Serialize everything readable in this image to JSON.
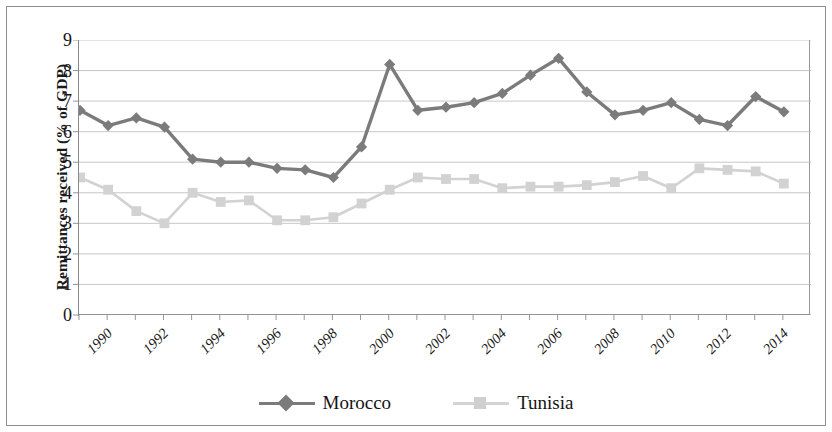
{
  "chart_data": {
    "type": "line",
    "title": "",
    "xlabel": "",
    "ylabel": "Remittances received (% of GDP)",
    "x": [
      1990,
      1991,
      1992,
      1993,
      1994,
      1995,
      1996,
      1997,
      1998,
      1999,
      2000,
      2001,
      2002,
      2003,
      2004,
      2005,
      2006,
      2007,
      2008,
      2009,
      2010,
      2011,
      2012,
      2013,
      2014,
      2015
    ],
    "xtick_labels": [
      "1990",
      "1992",
      "1994",
      "1996",
      "1998",
      "2000",
      "2002",
      "2004",
      "2006",
      "2008",
      "2010",
      "2012",
      "2014"
    ],
    "ytick_labels": [
      "0",
      "1",
      "2",
      "3",
      "4",
      "5",
      "6",
      "7",
      "8",
      "9"
    ],
    "ylim": [
      0,
      9
    ],
    "xlim": [
      1990,
      2015
    ],
    "grid": true,
    "legend_position": "bottom",
    "series": [
      {
        "name": "Morocco",
        "color": "#7b7b7b",
        "marker": "diamond",
        "values": [
          6.7,
          6.2,
          6.45,
          6.15,
          5.1,
          5.0,
          5.0,
          4.8,
          4.75,
          4.5,
          5.5,
          8.2,
          6.7,
          6.8,
          6.95,
          7.25,
          7.85,
          8.4,
          7.3,
          6.55,
          6.7,
          6.95,
          6.4,
          6.2,
          7.15,
          6.65
        ]
      },
      {
        "name": "Tunisia",
        "color": "#d2d2d2",
        "marker": "square",
        "values": [
          4.5,
          4.1,
          3.4,
          3.0,
          4.0,
          3.7,
          3.75,
          3.1,
          3.1,
          3.2,
          3.65,
          4.1,
          4.5,
          4.45,
          4.45,
          4.15,
          4.2,
          4.2,
          4.25,
          4.35,
          4.55,
          4.15,
          4.8,
          4.75,
          4.7,
          4.3
        ]
      }
    ]
  },
  "legend": {
    "items": [
      {
        "label": "Morocco"
      },
      {
        "label": "Tunisia"
      }
    ]
  }
}
